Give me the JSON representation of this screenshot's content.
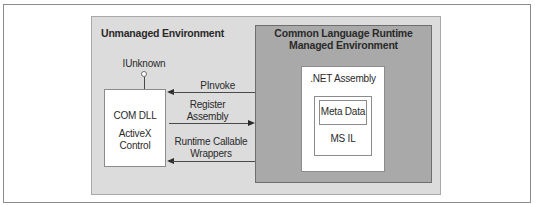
{
  "diagram": {
    "unmanaged_env": {
      "title": "Unmanaged Environment"
    },
    "managed_env": {
      "title_line1": "Common Language Runtime",
      "title_line2": "Managed Environment"
    },
    "com_component": {
      "interface_label": "IUnknown",
      "line1": "COM DLL",
      "line2": "ActiveX Control"
    },
    "arrows": [
      {
        "label": "PInvoke",
        "direction": "to-unmanaged"
      },
      {
        "label_line1": "Register",
        "label_line2": "Assembly",
        "direction": "to-managed"
      },
      {
        "label_line1": "Runtime Callable",
        "label_line2": "Wrappers",
        "direction": "to-unmanaged"
      }
    ],
    "assembly": {
      "title": ".NET Assembly",
      "metadata": "Meta Data",
      "il": "MS IL"
    }
  }
}
